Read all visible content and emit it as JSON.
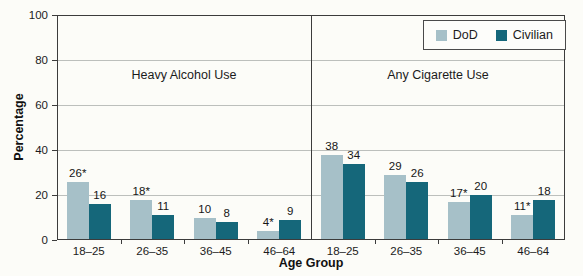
{
  "figure": {
    "y_axis_title": "Percentage",
    "x_axis_title": "Age Group",
    "y_ticks": [
      0,
      20,
      40,
      60,
      80,
      100
    ],
    "colors": {
      "dod": "#a6c0c8",
      "civilian": "#15677a",
      "axis": "#3c3c3c",
      "gridline": "#bcbfbc"
    },
    "legend": [
      {
        "label": "DoD",
        "color": "#a6c0c8"
      },
      {
        "label": "Civilian",
        "color": "#15677a"
      }
    ]
  },
  "chart_data": [
    {
      "type": "bar",
      "title": "Heavy Alcohol Use",
      "categories": [
        "18–25",
        "26–35",
        "36–45",
        "46–64"
      ],
      "xlabel": "Age Group",
      "ylabel": "Percentage",
      "ylim": [
        0,
        100
      ],
      "grid": "horizontal",
      "legend_position": "top-right",
      "series": [
        {
          "name": "DoD",
          "color": "#a6c0c8",
          "values": [
            26,
            18,
            10,
            4
          ],
          "labels": [
            "26*",
            "18*",
            "10",
            "4*"
          ]
        },
        {
          "name": "Civilian",
          "color": "#15677a",
          "values": [
            16,
            11,
            8,
            9
          ],
          "labels": [
            "16",
            "11",
            "8",
            "9"
          ]
        }
      ]
    },
    {
      "type": "bar",
      "title": "Any Cigarette Use",
      "categories": [
        "18–25",
        "26–35",
        "36–45",
        "46–64"
      ],
      "xlabel": "Age Group",
      "ylabel": "Percentage",
      "ylim": [
        0,
        100
      ],
      "grid": "horizontal",
      "legend_position": "top-right",
      "series": [
        {
          "name": "DoD",
          "color": "#a6c0c8",
          "values": [
            38,
            29,
            17,
            11
          ],
          "labels": [
            "38",
            "29",
            "17*",
            "11*"
          ]
        },
        {
          "name": "Civilian",
          "color": "#15677a",
          "values": [
            34,
            26,
            20,
            18
          ],
          "labels": [
            "34",
            "26",
            "20",
            "18"
          ]
        }
      ]
    }
  ]
}
